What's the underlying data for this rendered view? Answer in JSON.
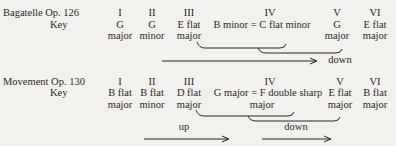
{
  "table1": {
    "title": "Bagatelle Op. 126",
    "key_label": "Key",
    "numerals": [
      "I",
      "II",
      "III",
      "IV",
      "V",
      "VI"
    ],
    "keys_line1": [
      "G",
      "G",
      "E flat",
      "B minor = C flat minor",
      "G",
      "E flat"
    ],
    "keys_line2": [
      "major",
      "minor",
      "major",
      "",
      "major",
      "major"
    ],
    "arrow_label": "down"
  },
  "table2": {
    "title": "Movement Op. 130",
    "key_label": "Key",
    "numerals": [
      "I",
      "II",
      "III",
      "IV",
      "V",
      "VI"
    ],
    "keys_line1": [
      "B flat",
      "B flat",
      "D flat",
      "G major = F double sharp",
      "E flat",
      "B flat"
    ],
    "keys_line2": [
      "major",
      "minor",
      "major",
      "major",
      "major",
      "major"
    ],
    "arrow_label_up": "up",
    "arrow_label_down": "down"
  }
}
